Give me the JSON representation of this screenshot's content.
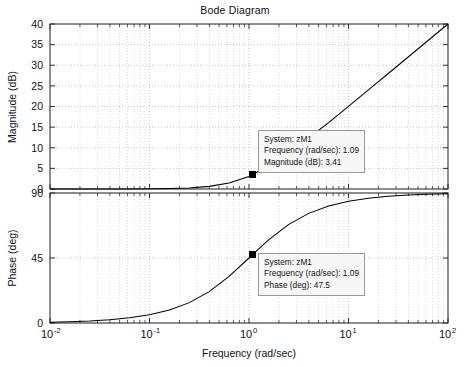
{
  "chart_data": {
    "type": "line",
    "title": "Bode Diagram",
    "xlabel": "Frequency (rad/sec)",
    "xscale": "log",
    "xlim": [
      0.01,
      100
    ],
    "xticks": [
      0.01,
      0.1,
      1,
      10,
      100
    ],
    "xticklabels": [
      "10-2",
      "10-1",
      "100",
      "101",
      "102"
    ],
    "xtick_mantissa": [
      "10",
      "10",
      "10",
      "10",
      "10"
    ],
    "xtick_exponent": [
      "-2",
      "-1",
      "0",
      "1",
      "2"
    ],
    "grid": true,
    "legend": "none",
    "subplots": [
      {
        "name": "magnitude",
        "ylabel": "Magnitude (dB)",
        "ylim": [
          0,
          40
        ],
        "yticks": [
          0,
          5,
          10,
          15,
          20,
          25,
          30,
          35,
          40
        ],
        "yticklabels": [
          "0",
          "5",
          "10",
          "15",
          "20",
          "25",
          "30",
          "35",
          "40"
        ],
        "series": [
          {
            "name": "zM1",
            "x": [
              0.01,
              0.0158,
              0.0251,
              0.0398,
              0.0631,
              0.1,
              0.1585,
              0.2512,
              0.3981,
              0.631,
              1.0,
              1.09,
              1.585,
              2.512,
              3.981,
              6.31,
              10.0,
              15.85,
              25.12,
              39.81,
              63.1,
              100.0
            ],
            "y": [
              0.0004,
              0.001,
              0.0027,
              0.0069,
              0.0172,
              0.0432,
              0.1076,
              0.2645,
              0.6379,
              1.4735,
              3.0103,
              3.41,
              5.9867,
              9.0135,
              12.3673,
              16.0875,
              20.0432,
              24.0106,
              28.0015,
              32.0006,
              36.0001,
              40.0
            ],
            "color": "#000000"
          }
        ],
        "datatip": {
          "system_label": "System: zM1",
          "frequency_label": "Frequency (rad/sec): 1.09",
          "value_label": "Magnitude (dB): 3.41",
          "marker_x": 1.09,
          "marker_y": 3.41
        }
      },
      {
        "name": "phase",
        "ylabel": "Phase (deg)",
        "ylim": [
          0,
          90
        ],
        "yticks": [
          0,
          45,
          90
        ],
        "yticklabels": [
          "0",
          "45",
          "90"
        ],
        "series": [
          {
            "name": "zM1",
            "x": [
              0.01,
              0.0158,
              0.0251,
              0.0398,
              0.0631,
              0.1,
              0.1585,
              0.2512,
              0.3981,
              0.631,
              1.0,
              1.09,
              1.585,
              2.512,
              3.981,
              6.31,
              10.0,
              15.85,
              25.12,
              39.81,
              63.1,
              100.0
            ],
            "y": [
              0.57,
              0.91,
              1.44,
              2.28,
              3.61,
              5.71,
              9.0,
              14.11,
              21.7,
              32.25,
              45.0,
              47.5,
              57.75,
              68.3,
              75.89,
              80.99,
              84.29,
              86.39,
              87.72,
              88.56,
              89.09,
              89.43
            ],
            "color": "#000000"
          }
        ],
        "datatip": {
          "system_label": "System: zM1",
          "frequency_label": "Frequency (rad/sec): 1.09",
          "value_label": "Phase (deg): 47.5",
          "marker_x": 1.09,
          "marker_y": 47.5
        }
      }
    ],
    "colors": {
      "curve": "#000000",
      "grid": "#b8b8b8",
      "axis": "#303030",
      "tip_background": "#f7f7f7",
      "tip_border": "#9a9a9a",
      "background": "#ffffff"
    }
  }
}
